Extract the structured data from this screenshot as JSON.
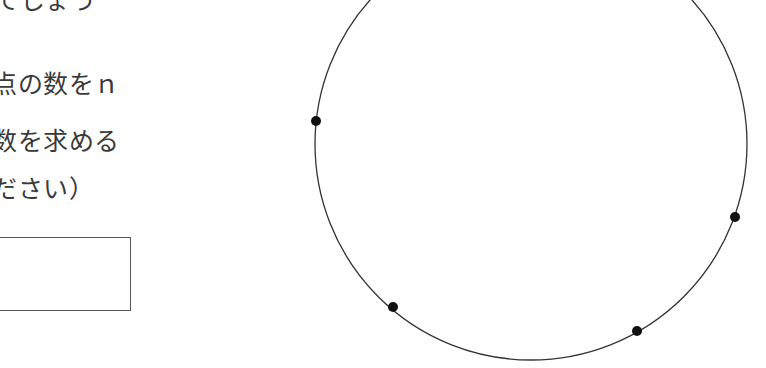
{
  "problem": {
    "lines": [
      "でしょう",
      "点の数をｎ",
      "数を求める",
      "ださい）"
    ]
  },
  "answer_box": {
    "value": ""
  },
  "figure": {
    "circle": {
      "cx": 531,
      "cy": 144,
      "r": 216,
      "stroke": "#333333"
    },
    "points": [
      {
        "x": 316,
        "y": 121
      },
      {
        "x": 735,
        "y": 217
      },
      {
        "x": 393,
        "y": 307
      },
      {
        "x": 637,
        "y": 331
      }
    ],
    "point_color": "#111111"
  }
}
